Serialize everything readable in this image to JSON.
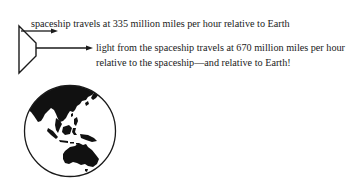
{
  "diagram": {
    "spaceship_label": "spaceship travels at 335 million miles per hour relative to Earth",
    "light_label_line1": "light from the spaceship travels at 670 million miles per hour",
    "light_label_line2": "relative to the spaceship—and relative to Earth!",
    "icons": {
      "spaceship": "spaceship-icon",
      "spaceship_arrow": "arrow-right-icon",
      "light_arrow": "arrow-right-icon",
      "earth": "globe-icon"
    },
    "colors": {
      "ink": "#1a1a1a",
      "background": "#ffffff"
    }
  }
}
